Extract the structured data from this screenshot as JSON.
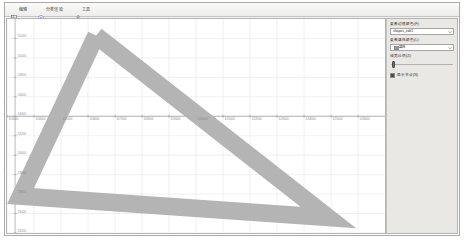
{
  "window": {
    "title": ""
  },
  "toolbar": {
    "items": [
      {
        "label": "编辑",
        "icon": "grid-icon"
      },
      {
        "label": "分类渲染",
        "icon": "palette-icon"
      },
      {
        "label": "工具",
        "icon": "wrench-icon"
      }
    ]
  },
  "properties": {
    "fields": [
      {
        "label": "要素边框颜色(F):",
        "value": "shapes_edit1",
        "type": "combo",
        "has_swatch": false
      },
      {
        "label": "要素填充颜色(L):",
        "value": "填充",
        "type": "combo",
        "has_swatch": true
      }
    ],
    "slider": {
      "label": "线宽比例(Z):",
      "value": 4,
      "min": 0,
      "max": 100
    },
    "checkbox": {
      "label": "显示节点(N)",
      "checked": true
    }
  },
  "colors": {
    "series_fill": "#b4b4b4",
    "grid_minor": "#e6e6e6",
    "grid_major": "#cfcfcf",
    "axis": "#9a9a9a",
    "panel_bg": "#e9e8e5",
    "plot_bg": "#ffffff",
    "tick_text": "#8e8c88"
  },
  "chart_data": {
    "type": "line",
    "title": "",
    "xlabel": "",
    "ylabel": "",
    "grid": true,
    "legend": "none",
    "xlim": [
      113000,
      127000
    ],
    "ylim": [
      23200,
      25400
    ],
    "xticks": [
      113000,
      114000,
      115000,
      116000,
      117000,
      118000,
      119000,
      120000,
      121000,
      122000,
      123000,
      124000,
      125000,
      126000
    ],
    "xtick_labels": [
      "113000",
      "114000",
      "115000",
      "116000",
      "117000",
      "118000",
      "119000",
      "120000",
      "121000",
      "122000",
      "123000",
      "124000",
      "125000",
      "126000"
    ],
    "yticks": [
      23200,
      23400,
      23600,
      23800,
      24000,
      24200,
      24400,
      24600,
      24800,
      25000,
      25200
    ],
    "ytick_labels": [
      "23200",
      "23400",
      "23600",
      "23800",
      "24000",
      "24200",
      "24400",
      "24600",
      "24800",
      "25000",
      "25200"
    ],
    "series": [
      {
        "name": "polygon-outline",
        "kind": "closed-band",
        "stroke_width_data": 180,
        "points": [
          {
            "x": 116300,
            "y": 25230
          },
          {
            "x": 124900,
            "y": 23360
          },
          {
            "x": 113500,
            "y": 23580
          },
          {
            "x": 116300,
            "y": 25230
          }
        ]
      }
    ]
  }
}
